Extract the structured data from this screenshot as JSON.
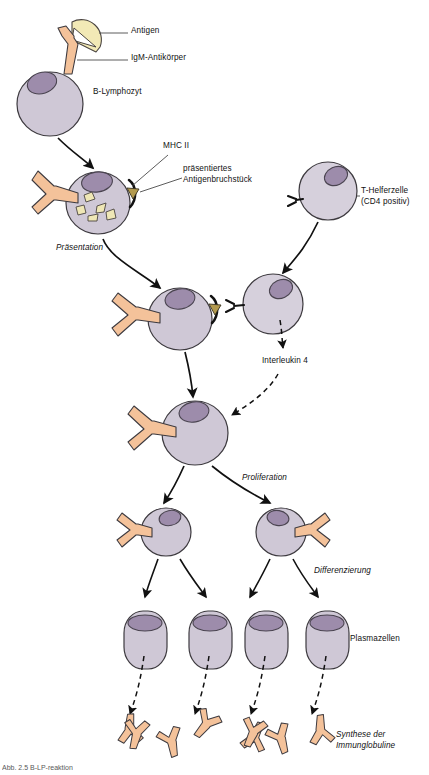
{
  "figure": {
    "caption": "Abb. 2.5 B-LP-reaktion",
    "background_color": "#ffffff"
  },
  "colors": {
    "cell_body": "#cfc8d6",
    "cell_body_light": "#d6d0dc",
    "cell_outline": "#3d3a3f",
    "nucleus": "#9d8cab",
    "nucleus_outline": "#4a4450",
    "antibody": "#f4c29a",
    "antibody_outline": "#3d3a3f",
    "antigen": "#f2e9b6",
    "antigen_outline": "#4a4440",
    "fragment": "#efe7b5",
    "mhc": "#121212",
    "mhc_fragment": "#b39a4e",
    "arrow": "#111111",
    "leader_line": "#4a4a4a",
    "text": "#111111"
  },
  "labels": {
    "antigen": "Antigen",
    "igm_antibody": "IgM-Antikörper",
    "b_lymphocyte": "B-Lymphozyt",
    "mhc_ii": "MHC II",
    "presented_fragment_line1": "präsentiertes",
    "presented_fragment_line2": "Antigenbruchstück",
    "presentation": "Präsentation",
    "t_helper_line1": "T-Helferzelle",
    "t_helper_line2": "(CD4 positiv)",
    "interleukin_4": "Interleukin 4",
    "proliferation": "Proliferation",
    "differentiation": "Differenzierung",
    "plasma_cells": "Plasmazellen",
    "synthesis_line1": "Synthese der",
    "synthesis_line2": "Immunglobuline"
  },
  "label_positions": {
    "antigen": {
      "x": 131,
      "y": 31
    },
    "igm_antibody": {
      "x": 131,
      "y": 58
    },
    "b_lymphocyte": {
      "x": 93,
      "y": 92
    },
    "mhc_ii": {
      "x": 163,
      "y": 146
    },
    "presented_fragment": {
      "x": 185,
      "y": 170
    },
    "presentation": {
      "x": 58,
      "y": 247
    },
    "t_helper": {
      "x": 363,
      "y": 192
    },
    "interleukin_4": {
      "x": 264,
      "y": 358
    },
    "proliferation": {
      "x": 243,
      "y": 477
    },
    "differentiation": {
      "x": 316,
      "y": 570
    },
    "plasma_cells": {
      "x": 352,
      "y": 638
    },
    "synthesis": {
      "x": 337,
      "y": 735
    }
  },
  "diagram_elements": {
    "stages": [
      {
        "id": "stage-1-binding",
        "name": "Antigenbindung",
        "cell": {
          "type": "b-lymphocyte",
          "cx": 50,
          "cy": 103,
          "r": 32
        },
        "nucleus": {
          "cx": 42,
          "cy": 82,
          "rx": 14,
          "ry": 10,
          "rotate": -18
        },
        "receptors": [
          "IgM-Antikörper"
        ],
        "antigen_attached": true
      },
      {
        "id": "stage-2-presentation",
        "name": "Präsentation",
        "cell": {
          "type": "b-lymphocyte",
          "cx": 98,
          "cy": 202,
          "r": 32
        },
        "nucleus": {
          "cx": 97,
          "cy": 181,
          "rx": 15,
          "ry": 10,
          "rotate": -8
        },
        "fragments_count": 5,
        "mhc": true
      },
      {
        "id": "stage-3-t-helper",
        "name": "T-Helferzelle",
        "cell": {
          "type": "t-helper",
          "cx": 328,
          "cy": 190,
          "r": 29
        },
        "nucleus": {
          "cx": 335,
          "cy": 176,
          "rx": 12,
          "ry": 9,
          "rotate": -25
        },
        "receptors": [
          "TCR"
        ]
      },
      {
        "id": "stage-4-contact",
        "name": "Zell-Zell-Kontakt",
        "b_cell": {
          "cx": 180,
          "cy": 318,
          "r": 32
        },
        "t_cell": {
          "cx": 273,
          "cy": 303,
          "r": 30
        }
      },
      {
        "id": "stage-5-activated",
        "name": "Aktivierter B-Lymphozyt",
        "cell": {
          "cx": 193,
          "cy": 432,
          "r": 33
        }
      },
      {
        "id": "stage-6-proliferation",
        "name": "Proliferation",
        "cells": [
          {
            "cx": 163,
            "cy": 531,
            "r": 25
          },
          {
            "cx": 282,
            "cy": 531,
            "r": 25
          }
        ]
      },
      {
        "id": "stage-7-plasma-cells",
        "name": "Plasmazellen",
        "cells": [
          {
            "x": 125,
            "y": 611,
            "w": 42,
            "h": 58
          },
          {
            "x": 191,
            "y": 611,
            "w": 42,
            "h": 58
          },
          {
            "x": 247,
            "y": 611,
            "w": 42,
            "h": 58
          },
          {
            "x": 307,
            "y": 611,
            "w": 42,
            "h": 58
          }
        ]
      },
      {
        "id": "stage-8-immunoglobulins",
        "name": "Synthese der Immunglobuline",
        "antibody_count": 8
      }
    ],
    "arrows": [
      {
        "from": "stage-1-binding",
        "to": "stage-2-presentation",
        "style": "solid"
      },
      {
        "from": "stage-2-presentation",
        "to": "stage-4-contact",
        "style": "solid"
      },
      {
        "from": "stage-3-t-helper",
        "to": "stage-4-contact",
        "style": "solid"
      },
      {
        "from": "stage-4-contact-tcell",
        "to": "interleukin-4",
        "style": "dashed"
      },
      {
        "from": "interleukin-4",
        "to": "stage-5-activated",
        "style": "dashed"
      },
      {
        "from": "stage-4-contact",
        "to": "stage-5-activated",
        "style": "solid"
      },
      {
        "from": "stage-5-activated",
        "to": "stage-6-proliferation",
        "style": "solid",
        "count": 2
      },
      {
        "from": "stage-6-proliferation",
        "to": "stage-7-plasma-cells",
        "style": "solid",
        "count": 4
      },
      {
        "from": "stage-7-plasma-cells",
        "to": "stage-8-immunoglobulins",
        "style": "dashed",
        "count": 4
      }
    ]
  }
}
